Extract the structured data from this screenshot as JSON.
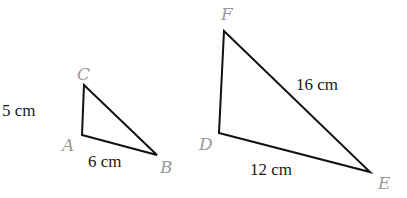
{
  "diagram": {
    "colors": {
      "edge": "#111111",
      "vertex_label": "#9a9a9a",
      "length_label": "#1a1a1a"
    },
    "triangles": [
      {
        "name": "ABC",
        "vertices": {
          "A": [
            82,
            135
          ],
          "B": [
            157,
            155
          ],
          "C": [
            84,
            85
          ]
        },
        "vertex_labels": {
          "A": "A",
          "B": "B",
          "C": "C"
        },
        "side_labels": {
          "AC": "5 cm",
          "AB": "6 cm"
        }
      },
      {
        "name": "DEF",
        "vertices": {
          "D": [
            219,
            133
          ],
          "E": [
            370,
            172
          ],
          "F": [
            224,
            31
          ]
        },
        "vertex_labels": {
          "D": "D",
          "E": "E",
          "F": "F"
        },
        "side_labels": {
          "FE": "16 cm",
          "DE": "12 cm"
        }
      }
    ]
  }
}
